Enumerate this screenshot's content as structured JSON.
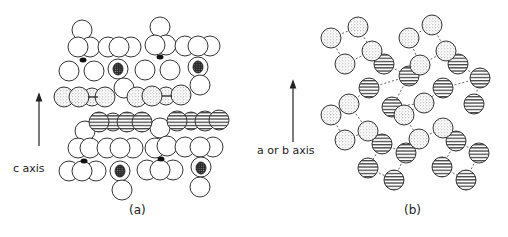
{
  "panel_a": {
    "caption": "(a)",
    "axis_label": "c axis"
  },
  "panel_b": {
    "caption": "(b)",
    "axis_label": "a or b axis"
  },
  "colors": {
    "stroke": "#333333",
    "background": "#ffffff",
    "stipple": "#bbbbbb",
    "hatch": "#444444",
    "dot": "#111111"
  }
}
